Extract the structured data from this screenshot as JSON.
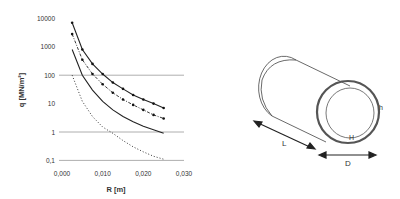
{
  "chart_data": {
    "type": "line",
    "title": "",
    "xlabel": "R  [m]",
    "ylabel": "q  [MN/m²]",
    "xlim": [
      0,
      0.03
    ],
    "ylim": [
      0.1,
      10000
    ],
    "yscale": "log",
    "x_ticks": [
      "0,000",
      "0,010",
      "0,020",
      "0,030"
    ],
    "y_ticks": [
      "10000",
      "1000",
      "100",
      "10",
      "1",
      "0,1"
    ],
    "gridlines_y": [
      100,
      1,
      0.1
    ],
    "legend": "none",
    "series": [
      {
        "name": "upper-solid-markers",
        "style": "solid",
        "markers": true,
        "x": [
          0.0025,
          0.005,
          0.0075,
          0.01,
          0.0125,
          0.015,
          0.0175,
          0.02,
          0.0225,
          0.025
        ],
        "values": [
          7000,
          800,
          250,
          110,
          55,
          33,
          20,
          14,
          10,
          7
        ]
      },
      {
        "name": "dashdot-markers",
        "style": "dashdot",
        "markers": true,
        "x": [
          0.0025,
          0.005,
          0.0075,
          0.01,
          0.0125,
          0.015,
          0.0175,
          0.02,
          0.0225,
          0.025
        ],
        "values": [
          2800,
          350,
          110,
          48,
          24,
          14,
          9,
          6,
          4,
          3
        ]
      },
      {
        "name": "lower-solid",
        "style": "solid",
        "markers": false,
        "x": [
          0.0025,
          0.005,
          0.0075,
          0.01,
          0.0125,
          0.015,
          0.0175,
          0.02,
          0.0225,
          0.025
        ],
        "values": [
          800,
          100,
          30,
          12,
          6,
          3.5,
          2.3,
          1.6,
          1.2,
          0.9
        ]
      },
      {
        "name": "dotted",
        "style": "dotted",
        "markers": false,
        "x": [
          0.0025,
          0.005,
          0.0075,
          0.01,
          0.0125,
          0.015,
          0.0175,
          0.02,
          0.0225,
          0.025
        ],
        "values": [
          100,
          12,
          3.5,
          1.5,
          0.9,
          0.5,
          0.3,
          0.2,
          0.14,
          0.11
        ]
      }
    ]
  },
  "diagram": {
    "labels": {
      "length": "L",
      "diameter": "D",
      "thickness": "h",
      "inner": "H"
    }
  }
}
